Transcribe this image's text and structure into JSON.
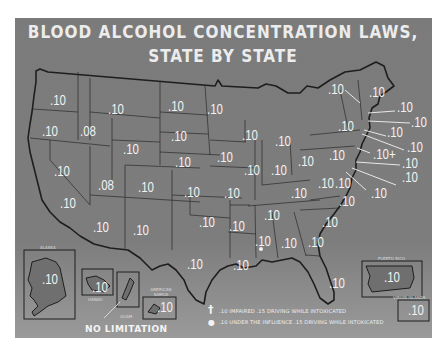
{
  "title": {
    "line1": "BLOOD ALCOHOL CONCENTRATION LAWS,",
    "line2": "STATE BY STATE"
  },
  "colors": {
    "panel": "#7b7b7b",
    "text": "#f2f2f2",
    "borders": "#1e1e1e",
    "page": "#ffffff"
  },
  "states": [
    {
      "abbr": "WASH.",
      "value": ".10",
      "x": 50,
      "y": 93
    },
    {
      "abbr": "OREG.",
      "value": ".10",
      "x": 42,
      "y": 124
    },
    {
      "abbr": "CALIF.",
      "value": ".10",
      "x": 54,
      "y": 164
    },
    {
      "abbr": "NEV.",
      "value": ".10",
      "x": 60,
      "y": 196
    },
    {
      "abbr": "IDAHO",
      "value": ".08",
      "x": 80,
      "y": 124
    },
    {
      "abbr": "MONT.",
      "value": ".10",
      "x": 108,
      "y": 102
    },
    {
      "abbr": "WYO.",
      "value": ".10",
      "x": 123,
      "y": 142
    },
    {
      "abbr": "UTAH",
      "value": ".08",
      "x": 98,
      "y": 178
    },
    {
      "abbr": "COLO.",
      "value": ".10",
      "x": 138,
      "y": 180
    },
    {
      "abbr": "ARIZ.",
      "value": ".10",
      "x": 93,
      "y": 220
    },
    {
      "abbr": "N. MEX.",
      "value": ".10",
      "x": 133,
      "y": 223
    },
    {
      "abbr": "N. DAK.",
      "value": ".10",
      "x": 168,
      "y": 99
    },
    {
      "abbr": "S. DAK.",
      "value": ".10",
      "x": 171,
      "y": 129
    },
    {
      "abbr": "NEBR.",
      "value": ".10",
      "x": 175,
      "y": 155
    },
    {
      "abbr": "KANS.",
      "value": ".10",
      "x": 184,
      "y": 185
    },
    {
      "abbr": "OKLA.",
      "value": ".10",
      "x": 199,
      "y": 215
    },
    {
      "abbr": "TEX.",
      "value": ".10",
      "x": 187,
      "y": 257
    },
    {
      "abbr": "MINN.",
      "value": ".10",
      "x": 207,
      "y": 102
    },
    {
      "abbr": "IOWA",
      "value": ".10",
      "x": 217,
      "y": 150
    },
    {
      "abbr": "MO.",
      "value": ".10",
      "x": 224,
      "y": 186
    },
    {
      "abbr": "ARK.",
      "value": ".10",
      "x": 229,
      "y": 219
    },
    {
      "abbr": "LA.",
      "value": ".10",
      "x": 233,
      "y": 258
    },
    {
      "abbr": "WISC.",
      "value": ".10",
      "x": 242,
      "y": 128
    },
    {
      "abbr": "ILL.",
      "value": ".10",
      "x": 244,
      "y": 163
    },
    {
      "abbr": "MICH.",
      "value": ".10",
      "x": 275,
      "y": 134
    },
    {
      "abbr": "IND.",
      "value": ".10",
      "x": 271,
      "y": 163
    },
    {
      "abbr": "OHIO",
      "value": ".10",
      "x": 298,
      "y": 154
    },
    {
      "abbr": "KY.",
      "value": ".10",
      "x": 291,
      "y": 186
    },
    {
      "abbr": "TENN.",
      "value": ".10",
      "x": 264,
      "y": 208
    },
    {
      "abbr": "MISS.",
      "value": ".10",
      "x": 255,
      "y": 234
    },
    {
      "abbr": "ALA.",
      "value": ".10",
      "x": 281,
      "y": 236
    },
    {
      "abbr": "GA.",
      "value": ".10",
      "x": 308,
      "y": 235
    },
    {
      "abbr": "FLA.",
      "value": ".10",
      "x": 329,
      "y": 276
    },
    {
      "abbr": "S.C.",
      "value": ".10",
      "x": 322,
      "y": 215
    },
    {
      "abbr": "N.C.",
      "value": ".10",
      "x": 339,
      "y": 194
    },
    {
      "abbr": "VA.",
      "value": ".10",
      "x": 335,
      "y": 176
    },
    {
      "abbr": "W. VA.",
      "value": ".10",
      "x": 318,
      "y": 176
    },
    {
      "abbr": "PA.",
      "value": ".10",
      "x": 329,
      "y": 148
    },
    {
      "abbr": "N.Y.",
      "value": ".10",
      "x": 338,
      "y": 119
    },
    {
      "abbr": "VT.",
      "value": ".10",
      "x": 328,
      "y": 82
    },
    {
      "abbr": "MAINE",
      "value": ".10",
      "x": 369,
      "y": 85
    },
    {
      "abbr": "N.H.",
      "value": ".10",
      "x": 397,
      "y": 100
    },
    {
      "abbr": "MASS.",
      "value": ".10",
      "x": 411,
      "y": 115
    },
    {
      "abbr": "R.I.",
      "value": ".10",
      "x": 387,
      "y": 125
    },
    {
      "abbr": "CONN.",
      "value": ".10",
      "x": 407,
      "y": 140
    },
    {
      "abbr": "N.J.",
      "value": ".10+",
      "x": 373,
      "y": 147
    },
    {
      "abbr": "DEL.",
      "value": ".10",
      "x": 402,
      "y": 156
    },
    {
      "abbr": "MD.",
      "value": ".10",
      "x": 402,
      "y": 170
    },
    {
      "abbr": "D.C.",
      "value": ".10",
      "x": 371,
      "y": 186
    }
  ],
  "insets": [
    {
      "name": "ALASKA",
      "value": ".10"
    },
    {
      "name": "HAWAII",
      "value": ".10"
    },
    {
      "name": "GUAM",
      "value": ""
    },
    {
      "name": "AMERICAN SAMOA",
      "value": ".10"
    },
    {
      "name": "PUERTO RICO",
      "value": ".10"
    },
    {
      "name": "VIRGIN ISLANDS",
      "value": ".10"
    }
  ],
  "guam_note": "NO LIMITATION",
  "legend": [
    {
      "symbol": "†",
      "text": ".10 IMPAIRED  .15 DRIVING WHILE INTOXICATED"
    },
    {
      "symbol": "●",
      "text": ".10 UNDER THE INFLUENCE  .15 DRIVING WHILE INTOXICATED"
    }
  ]
}
